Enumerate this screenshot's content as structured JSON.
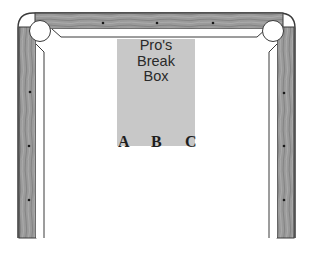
{
  "diagram": {
    "break_box": {
      "label_lines": [
        "Pro's",
        "Break",
        "Box"
      ],
      "fill": "#c8c8c8"
    },
    "positions": [
      {
        "label": "A"
      },
      {
        "label": "B"
      },
      {
        "label": "C"
      }
    ],
    "colors": {
      "rail_wood": "#8f8f8f",
      "rail_edge": "#3a3a3a",
      "felt": "#ffffff",
      "diamond": "#1a1a1a"
    },
    "diamonds": {
      "top": 3,
      "left": 3,
      "right": 3
    }
  }
}
